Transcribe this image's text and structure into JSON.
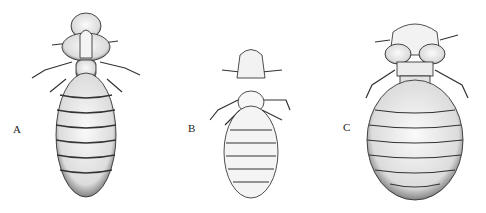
{
  "figure": {
    "panels": [
      {
        "label": "A",
        "subject": "louse-specimen-a"
      },
      {
        "label": "B",
        "subject": "louse-specimen-b"
      },
      {
        "label": "C",
        "subject": "louse-specimen-c"
      }
    ]
  }
}
